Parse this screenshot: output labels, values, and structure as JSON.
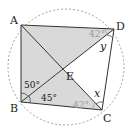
{
  "diagram": {
    "type": "cyclic-quadrilateral",
    "points": {
      "A": {
        "label": "A",
        "x": 21,
        "y": 25
      },
      "B": {
        "label": "B",
        "x": 21,
        "y": 102
      },
      "C": {
        "label": "C",
        "x": 102,
        "y": 110
      },
      "D": {
        "label": "D",
        "x": 114,
        "y": 29
      },
      "E": {
        "label": "E",
        "x": 63,
        "y": 70
      }
    },
    "circle": {
      "cx": 66,
      "cy": 67,
      "r": 58,
      "style": "dashed"
    },
    "angles": {
      "ABE": "50°",
      "EBC": "45°",
      "ADB": "42°",
      "BCA": "42°",
      "x": "x",
      "y": "y"
    },
    "colors": {
      "shade": "#d9d9d9",
      "line": "#333333",
      "circle": "#888888",
      "gray_text": "#9a9a9a"
    }
  }
}
